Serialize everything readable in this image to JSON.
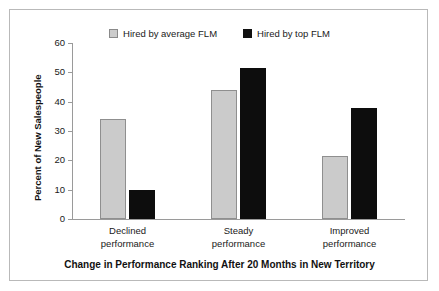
{
  "chart_data": {
    "type": "bar",
    "title": "",
    "xlabel": "Change in Performance Ranking After 20 Months in New Territory",
    "ylabel": "Percent of New Salespeople",
    "categories": [
      "Declined performance",
      "Steady performance",
      "Improved performance"
    ],
    "category_lines": [
      [
        "Declined",
        "performance"
      ],
      [
        "Steady",
        "performance"
      ],
      [
        "Improved",
        "performance"
      ]
    ],
    "series": [
      {
        "name": "Hired by average FLM",
        "color": "#cbcbcb",
        "values": [
          34,
          44,
          21.5
        ]
      },
      {
        "name": "Hired by top FLM",
        "color": "#0d0d0d",
        "values": [
          10,
          51.5,
          38
        ]
      }
    ],
    "ylim": [
      0,
      60
    ],
    "ytick_values": [
      60,
      50,
      40,
      30,
      20,
      10,
      0
    ],
    "ytick_labels": [
      "60",
      "50",
      "40",
      "30",
      "20",
      "10",
      "0"
    ],
    "grid": false,
    "legend_position": "top-center"
  },
  "legend": {
    "items": [
      {
        "label": "Hired by average FLM",
        "swatch": "gray-square-swatch"
      },
      {
        "label": "Hired by top FLM",
        "swatch": "black-square-swatch"
      }
    ]
  },
  "axes": {
    "y_title": "Percent of New Salespeople",
    "x_title": "Change in Performance Ranking After 20 Months in New Territory"
  },
  "colors": {
    "series_average": "#cbcbcb",
    "series_top": "#0d0d0d",
    "axis": "#9a9a9a",
    "frame": "#b9b9b9",
    "text": "#1a1a1a"
  }
}
